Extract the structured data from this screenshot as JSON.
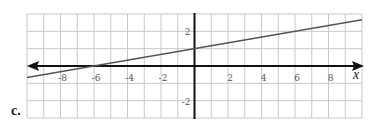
{
  "figure_label": "c.",
  "chart_data": {
    "type": "line",
    "title": "",
    "xlabel": "x",
    "ylabel": "",
    "xlim": [
      -10,
      10
    ],
    "ylim": [
      -3,
      3
    ],
    "grid": true,
    "x_ticks": [
      -8,
      -6,
      -4,
      -2,
      2,
      4,
      6,
      8
    ],
    "x_tick_labels": [
      "-8",
      "-6",
      "-4",
      "-2",
      "2",
      "4",
      "6",
      "8"
    ],
    "y_ticks": [
      2,
      -2
    ],
    "y_tick_labels": [
      "2",
      "-2"
    ],
    "series": [
      {
        "name": "line",
        "equation": "y = x/6 + 1",
        "slope": 0.1667,
        "intercept": 1,
        "x": [
          -10,
          -6,
          0,
          6,
          10
        ],
        "y": [
          -0.67,
          0,
          1,
          2,
          2.67
        ]
      }
    ],
    "x_axis_arrows": "both",
    "colors": {
      "grid": "#c8c8c8",
      "axis": "#111111",
      "line": "#555555"
    }
  }
}
